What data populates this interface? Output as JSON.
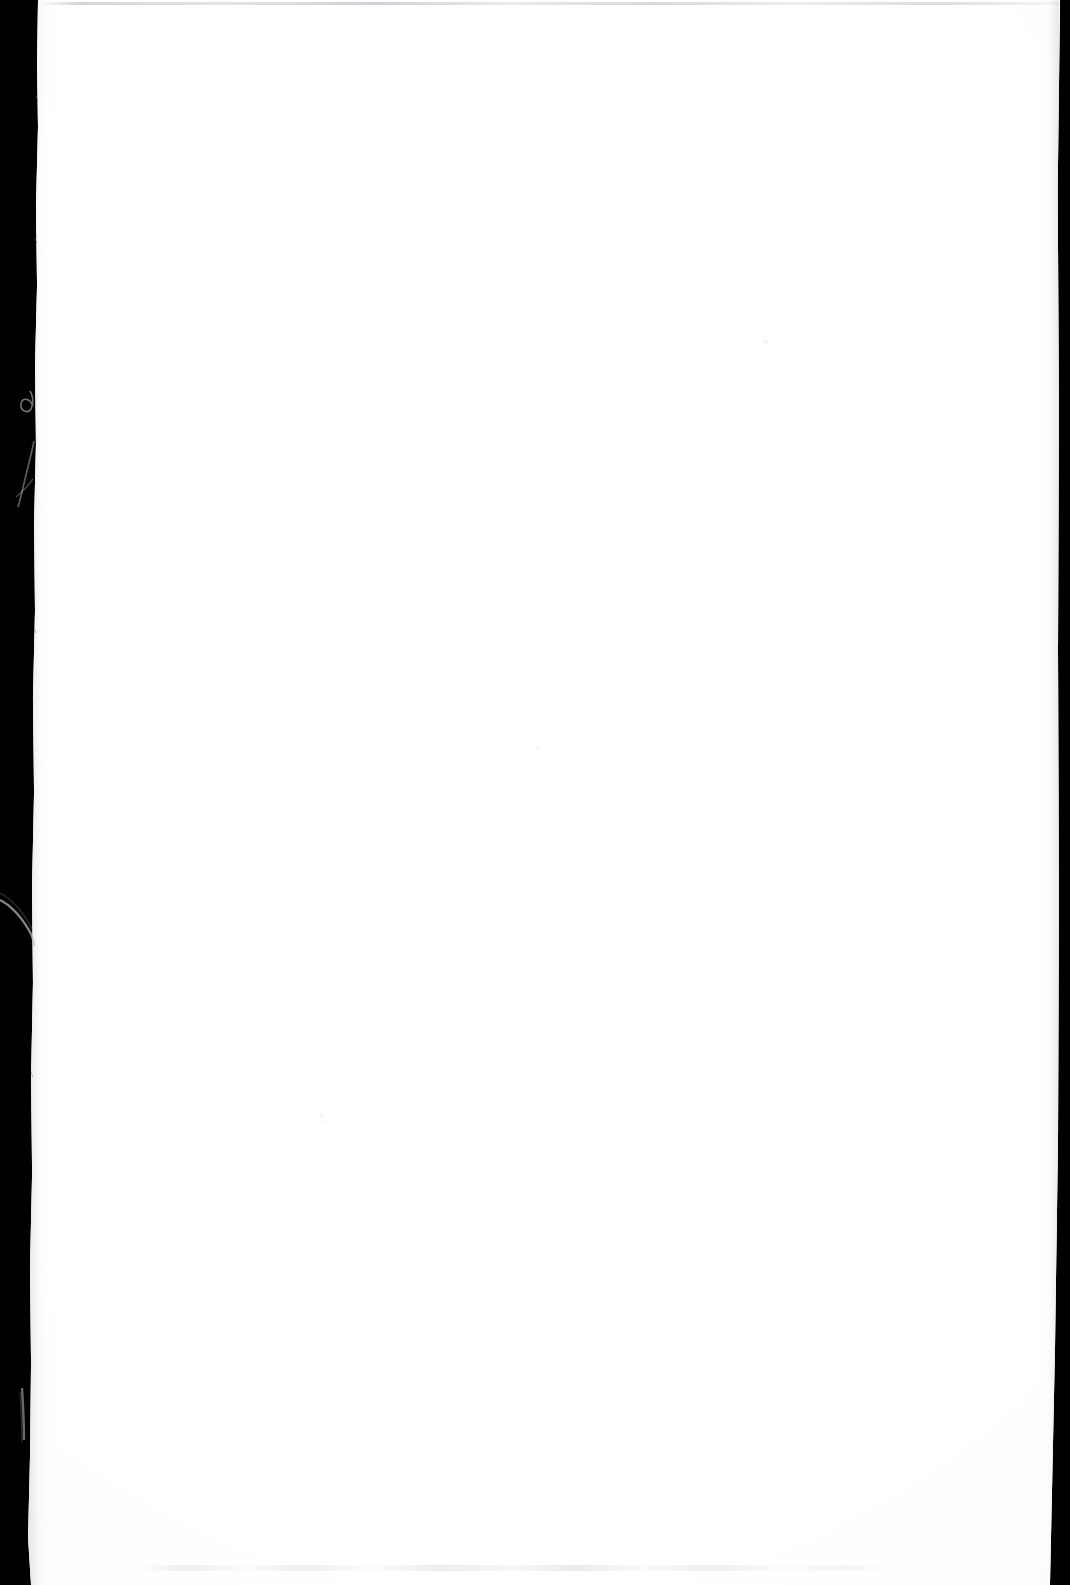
{
  "document": {
    "title": "Scanned blank page",
    "page_body_text": "",
    "page_number": "",
    "is_blank": "true"
  },
  "scan": {
    "media": "paper-sheet",
    "orientation": "portrait",
    "page_color": "#ffffff",
    "scanner_background_color": "#010101",
    "top_scan_line_color": "#c6c6cd",
    "speck_color": "#ededf1",
    "edge_shadow_color": "#78787d",
    "width_px": "1070",
    "height_px": "1585"
  },
  "artifacts": {
    "left_band": {
      "name": "left-scanner-band",
      "description": "dark scanner background along the left edge"
    },
    "right_band": {
      "name": "right-scanner-band",
      "description": "thin dark scanner background along the right edge"
    },
    "top_line": {
      "name": "top-scan-line",
      "description": "faint grey line across the top of the sheet"
    },
    "margin_ink_traces": {
      "name": "margin-ink-traces",
      "description": "faint pale handwriting strokes bleeding into the left dark band"
    },
    "specks": [
      {
        "name": "scan-speck",
        "x": 765,
        "y": 341,
        "size": 5,
        "opacity": 0.55
      },
      {
        "name": "scan-speck",
        "x": 538,
        "y": 748,
        "size": 4,
        "opacity": 0.45
      },
      {
        "name": "scan-speck",
        "x": 321,
        "y": 1115,
        "size": 5,
        "opacity": 0.5
      },
      {
        "name": "scan-speck",
        "x": 322,
        "y": 1121,
        "size": 3,
        "opacity": 0.4
      },
      {
        "name": "scan-speck",
        "x": 328,
        "y": 1118,
        "size": 2,
        "opacity": 0.35
      },
      {
        "name": "scan-speck",
        "x": 770,
        "y": 344,
        "size": 3,
        "opacity": 0.35
      },
      {
        "name": "scan-speck",
        "x": 259,
        "y": 1151,
        "size": 2,
        "opacity": 0.3
      }
    ],
    "bottom_dust": {
      "name": "bottom-dust-row",
      "description": "faint speckled dust along the bottom margin"
    }
  }
}
